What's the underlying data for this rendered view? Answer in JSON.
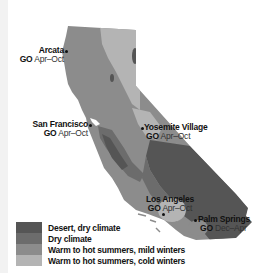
{
  "map": {
    "region": "California",
    "colors": {
      "desert": "#555555",
      "dry": "#6c6c6c",
      "mild": "#8c8c8c",
      "cold": "#b4b4b4",
      "background": "#ffffff"
    }
  },
  "places": [
    {
      "name": "Arcata",
      "go_prefix": "GO",
      "go_range": "Apr–Oct"
    },
    {
      "name": "San Francisco",
      "go_prefix": "GO",
      "go_range": "Apr–Oct"
    },
    {
      "name": "Yosemite Village",
      "go_prefix": "GO",
      "go_range": "Apr–Oct"
    },
    {
      "name": "Los Angeles",
      "go_prefix": "GO",
      "go_range": "Apr–Oct"
    },
    {
      "name": "Palm Springs",
      "go_prefix": "GO",
      "go_range": "Dec–Apr"
    }
  ],
  "legend": {
    "items": [
      {
        "label": "Desert, dry climate",
        "color": "#555555"
      },
      {
        "label": "Dry climate",
        "color": "#6c6c6c"
      },
      {
        "label": "Warm to hot summers, mild winters",
        "color": "#8c8c8c"
      },
      {
        "label": "Warm to hot summers, cold winters",
        "color": "#b4b4b4"
      }
    ]
  }
}
